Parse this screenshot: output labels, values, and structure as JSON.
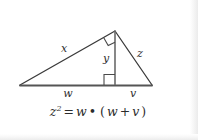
{
  "figure": {
    "type": "geometry-diagram",
    "stroke_color": "#3a3a3a",
    "baseline_color": "#555555",
    "label_color": "#2e2e2e",
    "background_color": "#ffffff",
    "labels": {
      "x": "x",
      "y": "y",
      "z": "z",
      "w": "w",
      "v": "v"
    },
    "label_meanings": {
      "x": "left leg of the large triangle (from left vertex to apex)",
      "y": "altitude from apex to the base",
      "z": "right leg of the large triangle (from apex to right vertex)",
      "w": "left segment of the base, from left vertex to foot of altitude",
      "v": "right segment of the base, from foot of altitude to right vertex"
    },
    "vertices": {
      "left": [
        20,
        85
      ],
      "apex": [
        115,
        31
      ],
      "right": [
        152,
        85
      ],
      "foot": [
        115,
        85
      ]
    },
    "right_angle_markers": [
      {
        "name": "apex-right-angle",
        "at": [
          115,
          31
        ]
      },
      {
        "name": "altitude-foot-right-angle",
        "at": [
          115,
          85
        ]
      }
    ]
  },
  "equation": {
    "lhs_var": "z",
    "lhs_exponent": "2",
    "equals": "=",
    "factor1": "w",
    "dot": "•",
    "open_paren": "(",
    "sum_left": "w",
    "plus": "+",
    "sum_right": "v",
    "close_paren": ")",
    "plain_text": "z² = w • (w + v)"
  }
}
